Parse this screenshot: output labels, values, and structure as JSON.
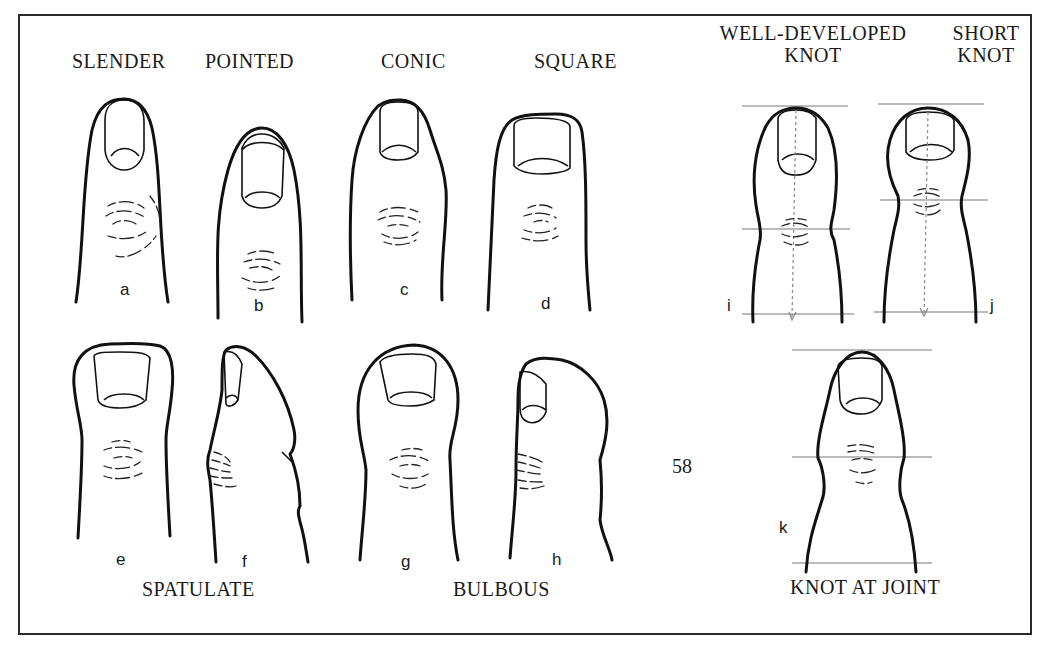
{
  "figure": {
    "page_number": "58",
    "captions": {
      "slender": "SLENDER",
      "pointed": "POINTED",
      "conic": "CONIC",
      "square": "SQUARE",
      "well_developed_knot_line1": "WELL-DEVELOPED",
      "well_developed_knot_line2": "KNOT",
      "short_knot_line1": "SHORT",
      "short_knot_line2": "KNOT",
      "spatulate": "SPATULATE",
      "bulbous": "BULBOUS",
      "knot_at_joint": "KNOT AT JOINT"
    },
    "panels": [
      {
        "id": "a",
        "label": "a",
        "type": "slender"
      },
      {
        "id": "b",
        "label": "b",
        "type": "pointed"
      },
      {
        "id": "c",
        "label": "c",
        "type": "conic"
      },
      {
        "id": "d",
        "label": "d",
        "type": "square"
      },
      {
        "id": "e",
        "label": "e",
        "type": "spatulate (front)"
      },
      {
        "id": "f",
        "label": "f",
        "type": "spatulate (side)"
      },
      {
        "id": "g",
        "label": "g",
        "type": "bulbous (front)"
      },
      {
        "id": "h",
        "label": "h",
        "type": "bulbous (side)"
      },
      {
        "id": "i",
        "label": "i",
        "type": "well-developed knot"
      },
      {
        "id": "j",
        "label": "j",
        "type": "short knot"
      },
      {
        "id": "k",
        "label": "k",
        "type": "knot at joint"
      }
    ],
    "colors": {
      "ink": "#111111",
      "guide_lines": "#777777",
      "background": "#ffffff"
    }
  }
}
